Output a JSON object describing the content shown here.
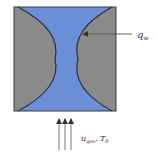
{
  "diagram": {
    "title": "",
    "colors": {
      "channel": "#6b8fd6",
      "solid": "#8a8a88",
      "outline": "#2a2f45",
      "arrow": "#555555",
      "text": "#333333"
    },
    "labels": {
      "heat_flux": "q",
      "heat_flux_sub": "w",
      "inlet_velocity": "u",
      "inlet_velocity_sub": "gas",
      "inlet_separator": ", ",
      "inlet_temperature": "T",
      "inlet_temperature_sub": "0"
    },
    "elements": [
      {
        "id": "domain-square",
        "type": "rect"
      },
      {
        "id": "left-solid",
        "type": "arc-region"
      },
      {
        "id": "right-solid",
        "type": "arc-region"
      },
      {
        "id": "flow-channel",
        "type": "region"
      },
      {
        "id": "heat-flux-arrow",
        "type": "arrow",
        "direction": "left"
      },
      {
        "id": "inflow-arrows",
        "type": "arrow-group",
        "count": 3,
        "direction": "up"
      }
    ]
  }
}
